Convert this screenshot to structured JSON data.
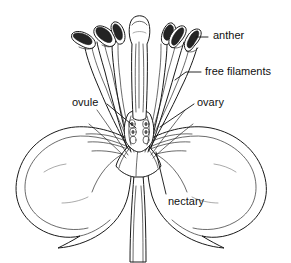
{
  "figure": {
    "kind": "botanical-line-drawing",
    "background_color": "#ffffff",
    "ink_color": "#1a1a1a",
    "width": 291,
    "height": 263
  },
  "labels": [
    {
      "id": "anther",
      "text": "anther",
      "text_x": 213,
      "text_y": 30,
      "leader": "M 208 37 L 196 37",
      "points_to": "curved anther head on right stamen"
    },
    {
      "id": "free-filaments",
      "text": "free filaments",
      "text_x": 205,
      "text_y": 66,
      "leader": "M 201 72 L 186 72 L 175 80",
      "points_to": "slender free filament stalks"
    },
    {
      "id": "ovule",
      "text": "ovule",
      "text_x": 72,
      "text_y": 97,
      "leader": "M 107 104 L 136 128",
      "points_to": "ovules inside ovary chamber"
    },
    {
      "id": "ovary",
      "text": "ovary",
      "text_x": 197,
      "text_y": 97,
      "leader": "M 194 104 L 160 127",
      "points_to": "ovary chamber at base of style"
    },
    {
      "id": "nectary",
      "text": "nectary",
      "text_x": 168,
      "text_y": 196,
      "leader": "M 166 194 L 156 152",
      "points_to": "nectary at receptacle base"
    }
  ],
  "structures": [
    {
      "id": "stigma",
      "name": "stigma",
      "description": "club-shaped head atop the central style"
    },
    {
      "id": "style",
      "name": "style",
      "description": "thick central column rising from the ovary"
    },
    {
      "id": "anthers",
      "name": "anthers",
      "description": "six curved dark pollen sacs on filament tips"
    },
    {
      "id": "filaments",
      "name": "free filaments",
      "description": "slender stalks fanning up from the receptacle"
    },
    {
      "id": "ovary",
      "name": "ovary",
      "description": "swollen chamber at the base of the style"
    },
    {
      "id": "ovules",
      "name": "ovules",
      "description": "small round bodies in two rows inside the ovary"
    },
    {
      "id": "petal-left",
      "name": "left petal",
      "description": "large rounded petal curving down to a point"
    },
    {
      "id": "petal-right",
      "name": "right petal",
      "description": "large rounded petal curving down to a point"
    },
    {
      "id": "nectary",
      "name": "nectary",
      "description": "tissue at the receptacle base"
    },
    {
      "id": "pedicel",
      "name": "pedicel",
      "description": "narrow flower stalk at the bottom"
    }
  ]
}
